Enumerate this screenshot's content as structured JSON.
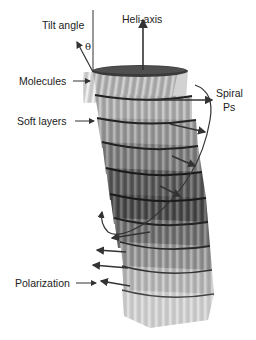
{
  "labels": {
    "tilt_angle": "Tilt angle",
    "theta": "θ",
    "heli_axis": "Heli-axis",
    "molecules": "Molecules",
    "spiral_ps_line1": "Spiral",
    "spiral_ps_line2": "Ps",
    "soft_layers": "Soft layers",
    "polarization": "Polarization"
  },
  "layers": [
    {
      "index": 0,
      "shade": "#cfcfcf",
      "offset_x": 0
    },
    {
      "index": 1,
      "shade": "#c4c4c4",
      "offset_x": 3
    },
    {
      "index": 2,
      "shade": "#a9a9a9",
      "offset_x": 6
    },
    {
      "index": 3,
      "shade": "#8a8a8a",
      "offset_x": 9
    },
    {
      "index": 4,
      "shade": "#5e5e5e",
      "offset_x": 10
    },
    {
      "index": 5,
      "shade": "#4d4d4d",
      "offset_x": 10
    },
    {
      "index": 6,
      "shade": "#7a7a7a",
      "offset_x": 8
    },
    {
      "index": 7,
      "shade": "#a5a5a5",
      "offset_x": 5
    },
    {
      "index": 8,
      "shade": "#cdcdcd",
      "offset_x": 2
    },
    {
      "index": 9,
      "shade": "#e3e3e3",
      "offset_x": 0
    }
  ],
  "colors": {
    "text": "#222222",
    "arrow": "#333333",
    "background": "#ffffff"
  }
}
